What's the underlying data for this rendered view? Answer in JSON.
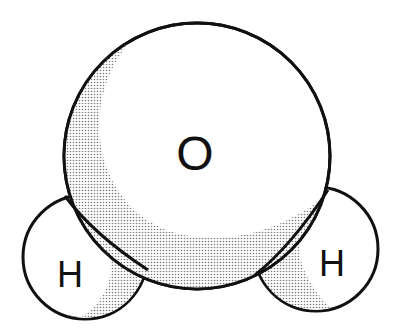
{
  "diagram": {
    "type": "space-filling molecular model",
    "atoms": [
      {
        "id": "oxygen",
        "label": "O",
        "cx": 197,
        "cy": 156,
        "r": 133
      },
      {
        "id": "hydrogen-left",
        "label": "H",
        "cx": 85,
        "cy": 257,
        "r": 62
      },
      {
        "id": "hydrogen-right",
        "label": "H",
        "cx": 316,
        "cy": 249,
        "r": 62
      }
    ],
    "colors": {
      "outline": "#111111",
      "fill": "#ffffff",
      "shading": "#8a8a8a"
    }
  }
}
